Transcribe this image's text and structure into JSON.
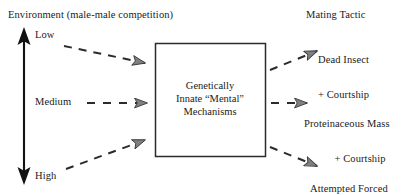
{
  "diagram": {
    "title_left": "Environment (male-male competition)",
    "title_right": "Mating Tactic",
    "center_box": {
      "line1": "Genetically",
      "line2": "Innate “Mental”",
      "line3": "Mechanisms"
    },
    "gradient_axis": {
      "name": "competition-intensity-axis",
      "top_label": "Low",
      "middle_label": "Medium",
      "bottom_label": "High",
      "style": "double-headed-vertical-arrow"
    },
    "input_arrows": [
      {
        "label": "Low",
        "style": "dashed",
        "direction": "toward-box"
      },
      {
        "label": "Medium",
        "style": "dashed",
        "direction": "toward-box"
      },
      {
        "label": "High",
        "style": "dashed",
        "direction": "toward-box"
      }
    ],
    "output_arrows": [
      {
        "label": "Dead Insect + Courtship",
        "style": "dashed",
        "direction": "away-from-box"
      },
      {
        "label": "Proteinaceous Mass + Courtship",
        "style": "dashed",
        "direction": "away-from-box"
      },
      {
        "label": "Attempted Forced Copulation",
        "style": "dashed",
        "direction": "away-from-box"
      }
    ],
    "tactics": [
      {
        "line1": "Dead Insect",
        "line2": "+ Courtship"
      },
      {
        "line1": "Proteinaceous Mass",
        "line2": "+ Courtship"
      },
      {
        "line1": "Attempted Forced",
        "line2": "Copulation"
      }
    ],
    "colors": {
      "stroke": "#1a1a1a",
      "arrow_fill": "#8a8a8a",
      "background": "#ffffff",
      "box_border": "#2b2b2b"
    }
  }
}
